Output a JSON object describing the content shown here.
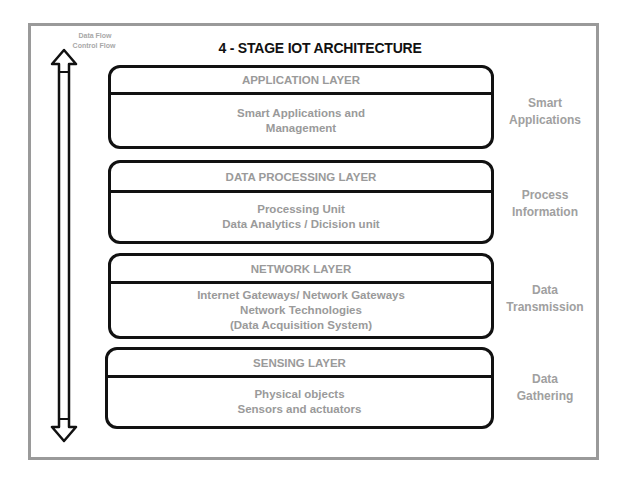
{
  "flow_labels": {
    "data_flow": "Data Flow",
    "control_flow": "Control Flow"
  },
  "title": "4 - STAGE IOT ARCHITECTURE",
  "layers": [
    {
      "header": "APPLICATION LAYER",
      "lines": [
        "Smart Applications and",
        "Management"
      ],
      "side": [
        "Smart",
        "Applications"
      ]
    },
    {
      "header": "DATA PROCESSING LAYER",
      "lines": [
        "Processing Unit",
        "Data Analytics / Dicision unit"
      ],
      "side": [
        "Process",
        "Information"
      ]
    },
    {
      "header": "NETWORK LAYER",
      "lines": [
        "Internet Gateways/ Network Gateways",
        "Network Technologies",
        "(Data Acquisition System)"
      ],
      "side": [
        "Data",
        "Transmission"
      ]
    },
    {
      "header": "SENSING LAYER",
      "lines": [
        "Physical objects",
        "Sensors and actuators"
      ],
      "side": [
        "Data",
        "Gathering"
      ]
    }
  ],
  "colors": {
    "frame": "#9a9a9a",
    "outline": "#111111",
    "text_gray": "#9a9a9a"
  }
}
